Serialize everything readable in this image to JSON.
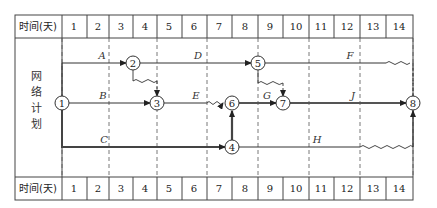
{
  "header": {
    "label": "时间(天)",
    "days": [
      "1",
      "2",
      "3",
      "4",
      "5",
      "6",
      "7",
      "8",
      "9",
      "10",
      "11",
      "12",
      "13",
      "14"
    ]
  },
  "footer": {
    "label": "时间(天)",
    "days": [
      "1",
      "2",
      "3",
      "4",
      "5",
      "6",
      "7",
      "8",
      "9",
      "10",
      "11",
      "12",
      "13",
      "14"
    ]
  },
  "side_label": [
    "网",
    "络",
    "计",
    "划"
  ],
  "nodes": [
    {
      "id": "1",
      "label": "1"
    },
    {
      "id": "2",
      "label": "2"
    },
    {
      "id": "3",
      "label": "3"
    },
    {
      "id": "4",
      "label": "4"
    },
    {
      "id": "5",
      "label": "5"
    },
    {
      "id": "6",
      "label": "6"
    },
    {
      "id": "7",
      "label": "7"
    },
    {
      "id": "8",
      "label": "8"
    }
  ],
  "activities": {
    "A": "A",
    "B": "B",
    "C": "C",
    "D": "D",
    "E": "E",
    "F": "F",
    "G": "G",
    "H": "H",
    "J": "J"
  },
  "colors": {
    "line": "#333333",
    "critical": "#555555",
    "grid": "#444444"
  }
}
